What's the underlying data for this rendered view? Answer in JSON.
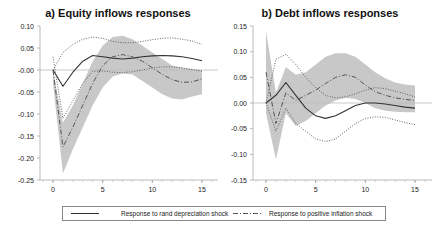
{
  "chart_data": [
    {
      "type": "line",
      "title": "a) Equity inflows responses",
      "xlabel": "",
      "ylabel": "",
      "x": [
        0,
        1,
        2,
        3,
        4,
        5,
        6,
        7,
        8,
        9,
        10,
        11,
        12,
        13,
        14,
        15
      ],
      "xticks": [
        0,
        5,
        10,
        15
      ],
      "yticks": [
        "0.10",
        "0.05",
        "-0.00",
        "-0.05",
        "-0.10",
        "-0.15",
        "-0.20",
        "-0.25"
      ],
      "ylim": [
        -0.25,
        0.1
      ],
      "xlim": [
        -1,
        16
      ],
      "grid": false,
      "series": [
        {
          "name": "Response to rand depreciation shock",
          "style": "solid",
          "values": [
            0.0,
            -0.037,
            -0.005,
            0.02,
            0.033,
            0.03,
            0.027,
            0.025,
            0.027,
            0.03,
            0.032,
            0.033,
            0.032,
            0.03,
            0.026,
            0.021
          ]
        },
        {
          "name": "Rand shock upper band",
          "style": "dotted",
          "values": [
            0.0,
            0.04,
            0.058,
            0.07,
            0.075,
            0.072,
            0.065,
            0.062,
            0.062,
            0.065,
            0.069,
            0.072,
            0.073,
            0.07,
            0.066,
            0.058
          ]
        },
        {
          "name": "Rand shock lower band",
          "style": "dotted",
          "values": [
            0.03,
            -0.11,
            -0.07,
            -0.03,
            -0.003,
            -0.002,
            -0.005,
            -0.006,
            -0.004,
            0.0,
            0.005,
            0.007,
            0.007,
            0.005,
            0.001,
            -0.003
          ]
        },
        {
          "name": "Response to positive inflation shock",
          "style": "dashdot",
          "values": [
            0.0,
            -0.175,
            -0.13,
            -0.08,
            -0.03,
            0.01,
            0.03,
            0.035,
            0.03,
            0.02,
            0.005,
            -0.01,
            -0.022,
            -0.028,
            -0.027,
            -0.02
          ]
        }
      ],
      "band": {
        "upper": [
          0.0,
          -0.12,
          -0.08,
          -0.03,
          0.02,
          0.055,
          0.075,
          0.078,
          0.07,
          0.055,
          0.04,
          0.025,
          0.01,
          0.005,
          0.002,
          0.0
        ],
        "lower": [
          -0.03,
          -0.235,
          -0.18,
          -0.13,
          -0.08,
          -0.04,
          -0.015,
          -0.008,
          -0.01,
          -0.025,
          -0.04,
          -0.055,
          -0.065,
          -0.067,
          -0.06,
          -0.055
        ]
      }
    },
    {
      "type": "line",
      "title": "b) Debt inflows responses",
      "xlabel": "",
      "ylabel": "",
      "x": [
        0,
        1,
        2,
        3,
        4,
        5,
        6,
        7,
        8,
        9,
        10,
        11,
        12,
        13,
        14,
        15
      ],
      "xticks": [
        0,
        5,
        10,
        15
      ],
      "yticks": [
        "0.15",
        "0.10",
        "0.05",
        "0.00",
        "-0.05",
        "-0.10",
        "-0.15"
      ],
      "ylim": [
        -0.15,
        0.15
      ],
      "xlim": [
        -1,
        16
      ],
      "grid": false,
      "series": [
        {
          "name": "Response to rand depreciation shock",
          "style": "solid",
          "values": [
            0.0,
            0.015,
            0.04,
            0.015,
            -0.01,
            -0.025,
            -0.03,
            -0.025,
            -0.015,
            -0.005,
            0.0,
            0.0,
            -0.002,
            -0.005,
            -0.008,
            -0.01
          ]
        },
        {
          "name": "Rand shock upper band",
          "style": "dotted",
          "values": [
            0.0,
            0.085,
            0.095,
            0.075,
            0.05,
            0.03,
            0.015,
            0.01,
            0.012,
            0.018,
            0.025,
            0.03,
            0.028,
            0.023,
            0.018,
            0.012
          ]
        },
        {
          "name": "Rand shock lower band",
          "style": "dotted",
          "values": [
            0.0,
            -0.055,
            -0.01,
            -0.04,
            -0.055,
            -0.07,
            -0.075,
            -0.07,
            -0.055,
            -0.04,
            -0.03,
            -0.027,
            -0.028,
            -0.033,
            -0.038,
            -0.042
          ]
        },
        {
          "name": "Response to positive inflation shock",
          "style": "dashdot",
          "values": [
            0.06,
            -0.04,
            0.02,
            0.005,
            0.015,
            0.025,
            0.038,
            0.05,
            0.055,
            0.05,
            0.035,
            0.022,
            0.015,
            0.01,
            0.007,
            0.005
          ]
        }
      ],
      "band": {
        "upper": [
          0.14,
          0.02,
          0.07,
          0.055,
          0.06,
          0.075,
          0.09,
          0.097,
          0.097,
          0.09,
          0.075,
          0.06,
          0.048,
          0.04,
          0.036,
          0.034
        ],
        "lower": [
          -0.02,
          -0.11,
          -0.02,
          -0.045,
          -0.035,
          -0.02,
          -0.005,
          0.005,
          0.01,
          0.008,
          0.0,
          -0.01,
          -0.015,
          -0.017,
          -0.018,
          -0.018
        ]
      }
    }
  ],
  "legend": {
    "solid_label": "Response to rand depreciation shock",
    "dashdot_label": "Response to positive inflation shock"
  }
}
